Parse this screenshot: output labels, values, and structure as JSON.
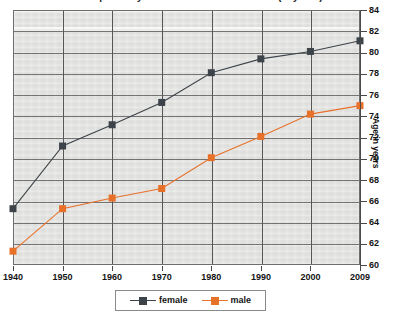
{
  "chart_data": {
    "type": "line",
    "title": "Life expectancy at birth in the United States (in years)",
    "xlabel": "",
    "ylabel": "Age in years",
    "categories": [
      "1940",
      "1950",
      "1960",
      "1970",
      "1980",
      "1990",
      "2000",
      "2009"
    ],
    "ylim": [
      60,
      84
    ],
    "yticks": [
      60,
      62,
      64,
      66,
      68,
      70,
      72,
      74,
      76,
      78,
      80,
      82,
      84
    ],
    "grid": true,
    "legend_position": "bottom",
    "series": [
      {
        "name": "female",
        "color": "#3d4449",
        "marker": "square",
        "values": [
          65.3,
          71.2,
          73.2,
          75.3,
          78.1,
          79.4,
          80.1,
          81.1
        ]
      },
      {
        "name": "male",
        "color": "#e8712a",
        "marker": "square",
        "values": [
          61.3,
          65.3,
          66.3,
          67.2,
          70.1,
          72.1,
          74.2,
          75.0
        ]
      }
    ]
  },
  "axis": {
    "y_title": "Age in years",
    "y_labels": [
      "84",
      "82",
      "80",
      "78",
      "76",
      "74",
      "72",
      "70",
      "68",
      "66",
      "64",
      "62",
      "60"
    ],
    "x_labels": [
      "1940",
      "1950",
      "1960",
      "1970",
      "1980",
      "1990",
      "2000",
      "2009"
    ]
  },
  "legend": {
    "entries": [
      {
        "label": "female",
        "color": "#3d4449"
      },
      {
        "label": "male",
        "color": "#e8712a"
      }
    ]
  },
  "colors": {
    "female": "#3d4449",
    "male": "#e8712a",
    "plot_background": "#e3e3e1",
    "gridline": "#737373",
    "axis": "#4a4a4a"
  }
}
